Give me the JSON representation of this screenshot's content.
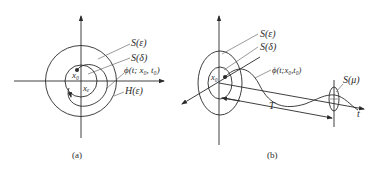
{
  "panel_a": {
    "caption": "(a)",
    "labels": {
      "s_eps": "S(ε)",
      "s_delta": "S(δ)",
      "phi": "ϕ(t; x₀, t₀)",
      "h_eps": "H(ε)",
      "x0": "x₀",
      "xe": "xₑ"
    }
  },
  "panel_b": {
    "caption": "(b)",
    "labels": {
      "s_eps": "S(ε)",
      "s_delta": "S(δ)",
      "phi": "ϕ(t;x₀,t₀)",
      "s_mu": "S(μ)",
      "x0": "x₀",
      "T": "T",
      "t": "t"
    }
  },
  "colors": {
    "ink": "#2a2a2a",
    "background": "#ffffff"
  }
}
